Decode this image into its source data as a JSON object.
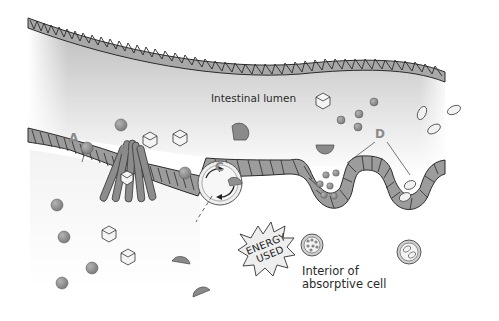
{
  "diagram": {
    "region_label": "Intestinal lumen",
    "interior_label_line1": "Interior of",
    "interior_label_line2": "absorptive cell",
    "energy_line1": "ENERGY",
    "energy_line2": "USED",
    "markers": {
      "a": "A",
      "b": "B",
      "c": "C",
      "d": "D"
    },
    "colors": {
      "molecule_fill": "#8f8f8f",
      "membrane_fill": "#9a9a9a",
      "membrane_stroke": "#2b2b2b",
      "lumen_gradient_top": "#c8c8c8",
      "background": "#ffffff",
      "marker_text": "#8a8a8a"
    },
    "elements": [
      "upper intestinal wall (hatched membrane)",
      "absorptive cell membrane with transporters",
      "A: simple diffusion of spherical molecules",
      "B: channel protein passing cube-shaped molecules",
      "C: carrier protein with rotation arrows (active transport)",
      "D: endocytosis / pinocytosis vesicles"
    ]
  }
}
